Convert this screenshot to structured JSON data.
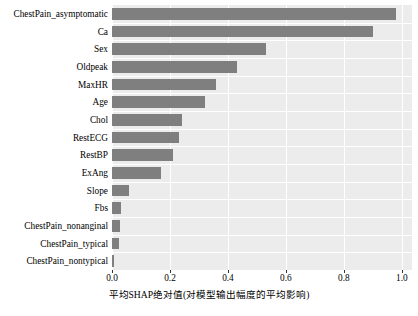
{
  "chart_data": {
    "type": "bar",
    "orientation": "horizontal",
    "title": "",
    "xlabel": "平均SHAP绝对值(对模型输出幅度的平均影响)",
    "ylabel": "",
    "categories": [
      "ChestPain_asymptomatic",
      "Ca",
      "Sex",
      "Oldpeak",
      "MaxHR",
      "Age",
      "Chol",
      "RestECG",
      "RestBP",
      "ExAng",
      "Slope",
      "Fbs",
      "ChestPain_nonanginal",
      "ChestPain_typical",
      "ChestPain_nontypical"
    ],
    "values": [
      0.98,
      0.9,
      0.53,
      0.43,
      0.36,
      0.32,
      0.24,
      0.23,
      0.21,
      0.17,
      0.06,
      0.03,
      0.028,
      0.025,
      0.008
    ],
    "xlim": [
      0.0,
      1.035
    ],
    "xticks": [
      0.0,
      0.2,
      0.4,
      0.6,
      0.8,
      1.0
    ],
    "xticklabels": [
      "0.0",
      "0.2",
      "0.4",
      "0.6",
      "0.8",
      "1.0"
    ],
    "grid": true,
    "legend": null,
    "bar_color": "#7f7f7f",
    "plot_background": "#ececec",
    "grid_color": "#ffffff"
  }
}
